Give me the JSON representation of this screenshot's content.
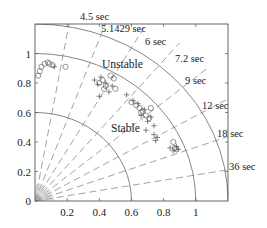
{
  "chart_data": {
    "type": "scatter",
    "title": "",
    "xlabel": "",
    "ylabel": "",
    "xlim": [
      0,
      1.2
    ],
    "ylim": [
      0,
      1.2
    ],
    "grid": false,
    "legend": null,
    "x_ticks": [
      {
        "value": 0.2,
        "label": "0.2"
      },
      {
        "value": 0.4,
        "label": "0.4"
      },
      {
        "value": 0.6,
        "label": "0.6"
      },
      {
        "value": 0.8,
        "label": "0.8"
      },
      {
        "value": 1.0,
        "label": "1"
      }
    ],
    "y_ticks": [
      {
        "value": 0,
        "label": "0"
      },
      {
        "value": 0.2,
        "label": "0.2"
      },
      {
        "value": 0.4,
        "label": "0.4"
      },
      {
        "value": 0.6,
        "label": "0.6"
      },
      {
        "value": 0.8,
        "label": "0.8"
      },
      {
        "value": 1.0,
        "label": "1"
      }
    ],
    "arcs": [
      {
        "radius": 0.6,
        "style": "solid"
      },
      {
        "radius": 1.0,
        "style": "solid"
      },
      {
        "radius": 1.2,
        "style": "solid"
      }
    ],
    "period_lines": [
      {
        "angle_deg": 80,
        "label": "4.5 sec",
        "lx": 80,
        "ly": 20
      },
      {
        "angle_deg": 70,
        "label": "5.1429 sec",
        "lx": 101,
        "ly": 32
      },
      {
        "angle_deg": 60,
        "label": "6 sec",
        "lx": 145,
        "ly": 45
      },
      {
        "angle_deg": 50,
        "label": "7.2 sec",
        "lx": 175,
        "ly": 62
      },
      {
        "angle_deg": 40,
        "label": "9 sec",
        "lx": 185,
        "ly": 84
      },
      {
        "angle_deg": 30,
        "label": "12 sec",
        "lx": 202,
        "ly": 109
      },
      {
        "angle_deg": 20,
        "label": "18 sec",
        "lx": 217,
        "ly": 137
      },
      {
        "angle_deg": 10,
        "label": "36 sec",
        "lx": 229,
        "ly": 170
      }
    ],
    "annotations": [
      {
        "text": "Unstable",
        "x": 102,
        "y": 68
      },
      {
        "text": "Stable",
        "x": 111,
        "y": 132
      }
    ],
    "series": [
      {
        "name": "circles",
        "marker": "o",
        "points": [
          [
            0.02,
            0.85
          ],
          [
            0.03,
            0.88
          ],
          [
            0.04,
            0.91
          ],
          [
            0.06,
            0.93
          ],
          [
            0.08,
            0.94
          ],
          [
            0.09,
            0.93
          ],
          [
            0.11,
            0.92
          ],
          [
            0.19,
            0.91
          ],
          [
            0.4,
            0.8
          ],
          [
            0.42,
            0.82
          ],
          [
            0.44,
            0.78
          ],
          [
            0.47,
            0.85
          ],
          [
            0.49,
            0.83
          ],
          [
            0.43,
            0.76
          ],
          [
            0.5,
            0.76
          ],
          [
            0.6,
            0.67
          ],
          [
            0.63,
            0.65
          ],
          [
            0.65,
            0.63
          ],
          [
            0.67,
            0.61
          ],
          [
            0.69,
            0.58
          ],
          [
            0.71,
            0.56
          ],
          [
            0.66,
            0.6
          ],
          [
            0.72,
            0.63
          ],
          [
            0.86,
            0.4
          ],
          [
            0.87,
            0.36
          ],
          [
            0.88,
            0.35
          ]
        ]
      },
      {
        "name": "crosses",
        "marker": "+",
        "points": [
          [
            0.12,
            0.91
          ],
          [
            0.37,
            0.82
          ],
          [
            0.39,
            0.79
          ],
          [
            0.41,
            0.84
          ],
          [
            0.44,
            0.8
          ],
          [
            0.46,
            0.74
          ],
          [
            0.4,
            0.71
          ],
          [
            0.48,
            0.78
          ],
          [
            0.57,
            0.72
          ],
          [
            0.61,
            0.68
          ],
          [
            0.64,
            0.66
          ],
          [
            0.66,
            0.58
          ],
          [
            0.68,
            0.62
          ],
          [
            0.7,
            0.54
          ],
          [
            0.72,
            0.57
          ],
          [
            0.74,
            0.51
          ],
          [
            0.69,
            0.48
          ],
          [
            0.74,
            0.45
          ],
          [
            0.76,
            0.43
          ],
          [
            0.75,
            0.41
          ],
          [
            0.84,
            0.36
          ],
          [
            0.86,
            0.34
          ],
          [
            0.89,
            0.35
          ],
          [
            0.88,
            0.37
          ]
        ]
      }
    ]
  }
}
